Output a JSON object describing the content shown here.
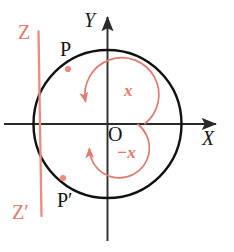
{
  "figure": {
    "background": "#ffffff",
    "colors": {
      "axis": "#2b2b2b",
      "circle": "#111111",
      "ray": "#e4796f",
      "arc": "#e4796f",
      "point_dot": "#ef8a80",
      "text_black": "#141414",
      "text_red": "#e4796f"
    },
    "axes": {
      "x_label": "X",
      "y_label": "Y",
      "origin_label": "O"
    },
    "points": [
      {
        "id": "P",
        "label": "P",
        "desc": "intersection of ray Z with circle in quadrant II"
      },
      {
        "id": "Pprime",
        "label": "P′",
        "desc": "intersection of ray Z-prime with circle in quadrant III"
      }
    ],
    "rays": [
      {
        "id": "Z",
        "label": "Z",
        "desc": "ray from origin up-left through P"
      },
      {
        "id": "Zprime",
        "label": "Z′",
        "desc": "ray from origin down-left through P-prime"
      }
    ],
    "angles": [
      {
        "id": "pos",
        "label": "x",
        "desc": "counterclockwise angle from positive X axis to ray OZ"
      },
      {
        "id": "neg",
        "label": "−x",
        "desc": "clockwise angle from positive X axis to ray OZ"
      }
    ],
    "geometry": {
      "center": {
        "cx": 107.5,
        "cy": 124
      },
      "radius": 74,
      "x_axis": {
        "x1": 4,
        "y1": 124,
        "x2": 221,
        "y2": 124
      },
      "y_axis": {
        "x1": 107.5,
        "y1": 240,
        "x2": 107.5,
        "y2": 12
      },
      "ray_line": {
        "x1": 38,
        "y1": 32,
        "x2": 41,
        "y2": 216
      },
      "P_dot": {
        "x": 68,
        "y": 69
      },
      "Pprime_dot": {
        "x": 63,
        "y": 178
      },
      "arc_pos_radius": 37,
      "arc_neg_radius": 30
    },
    "label_positions": {
      "Y": {
        "left": 84,
        "top": 10
      },
      "X": {
        "left": 202,
        "top": 128
      },
      "Z": {
        "left": 18,
        "top": 22
      },
      "Zprime": {
        "left": 12,
        "top": 202
      },
      "P": {
        "left": 60,
        "top": 39
      },
      "Pprime": {
        "left": 57,
        "top": 190
      },
      "O": {
        "left": 108,
        "top": 124
      },
      "x": {
        "left": 124,
        "top": 82
      },
      "negx": {
        "left": 117,
        "top": 144
      }
    }
  }
}
